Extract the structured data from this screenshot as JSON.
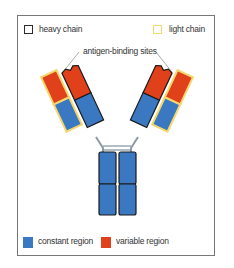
{
  "legend_top": {
    "heavy_chain": {
      "label": "heavy chain",
      "border_color": "#2b2b2b"
    },
    "light_chain": {
      "label": "light chain",
      "border_color": "#f5d76e"
    }
  },
  "annotation": {
    "label": "antigen-binding sites"
  },
  "legend_bottom": {
    "constant_region": {
      "label": "constant region",
      "color": "#3a78c2"
    },
    "variable_region": {
      "label": "variable region",
      "color": "#e0401a"
    }
  }
}
